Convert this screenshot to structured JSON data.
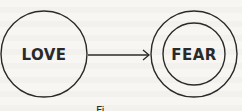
{
  "diagram": {
    "nodes": [
      {
        "id": "love",
        "label": "LOVE",
        "shape": "circle",
        "rings": 1
      },
      {
        "id": "fear",
        "label": "FEAR",
        "shape": "double-circle",
        "rings": 2
      }
    ],
    "edges": [
      {
        "from": "love",
        "to": "fear",
        "style": "arrow"
      }
    ],
    "caption": "Fi",
    "colors": {
      "stroke": "#2a2a2a",
      "background": "#f7f6f3"
    }
  }
}
